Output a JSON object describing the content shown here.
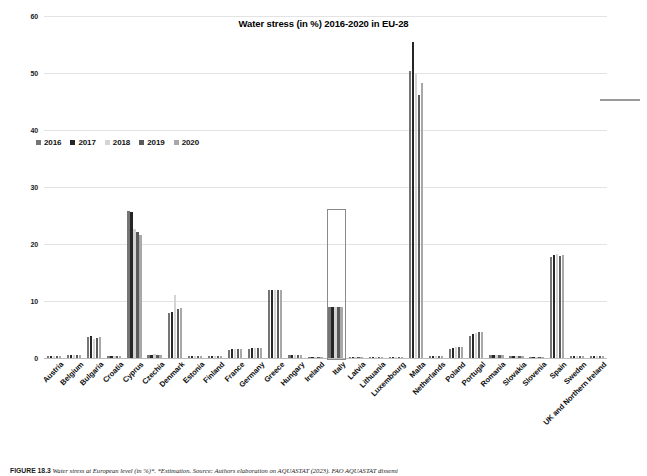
{
  "figure": {
    "title": "Water stress (in %) 2016-2020 in EU-28",
    "caption_label": "FIGURE 18.3",
    "caption_text": "Water stress at European level (in %)*. *Estimation. Source: Authors elaboration on AQUASTAT (2023). FAO AQUASTAT dissemi"
  },
  "legend": {
    "position": "upper-left-inside",
    "items": [
      {
        "label": "2016",
        "color": "#757575"
      },
      {
        "label": "2017",
        "color": "#262626"
      },
      {
        "label": "2018",
        "color": "#d4d4d4"
      },
      {
        "label": "2019",
        "color": "#5a5a5a"
      },
      {
        "label": "2020",
        "color": "#a8a8a8"
      }
    ]
  },
  "chart_data": {
    "type": "bar",
    "title": "Water stress (in %) 2016-2020 in EU-28",
    "xlabel": "",
    "ylabel": "",
    "ylim": [
      0,
      60
    ],
    "yticks": [
      0,
      10,
      20,
      30,
      40,
      50,
      60
    ],
    "grid": true,
    "legend_position": "upper-left-inside",
    "categories": [
      "Austria",
      "Belgium",
      "Bulgaria",
      "Croatia",
      "Cyprus",
      "Czechia",
      "Denmark",
      "Estonia",
      "Finland",
      "France",
      "Germany",
      "Greece",
      "Hungary",
      "Ireland",
      "Italy",
      "Latvia",
      "Lithuania",
      "Luxembourg",
      "Malta",
      "Netherlands",
      "Poland",
      "Portugal",
      "Romania",
      "Slovakia",
      "Slovenia",
      "Spain",
      "Sweden",
      "UK and Northern Ireland"
    ],
    "series": [
      {
        "name": "2016",
        "color": "#757575",
        "values": [
          0.4,
          0.5,
          3.6,
          0.3,
          25.8,
          0.6,
          7.9,
          0.3,
          0.3,
          1.4,
          1.6,
          11.9,
          0.5,
          0.2,
          8.9,
          0.2,
          0.2,
          0.2,
          50.4,
          0.3,
          1.6,
          3.9,
          0.5,
          0.3,
          0.2,
          17.8,
          0.3,
          0.4
        ]
      },
      {
        "name": "2017",
        "color": "#262626",
        "values": [
          0.4,
          0.5,
          3.8,
          0.3,
          25.6,
          0.6,
          8.0,
          0.3,
          0.3,
          1.5,
          1.7,
          12.0,
          0.5,
          0.2,
          9.0,
          0.2,
          0.2,
          0.2,
          55.4,
          0.3,
          1.7,
          4.2,
          0.5,
          0.3,
          0.2,
          18.0,
          0.3,
          0.4
        ]
      },
      {
        "name": "2018",
        "color": "#d4d4d4",
        "values": [
          0.4,
          0.6,
          3.3,
          0.3,
          22.7,
          0.7,
          11.0,
          0.3,
          0.3,
          1.6,
          1.8,
          11.9,
          0.5,
          0.2,
          8.9,
          0.2,
          0.2,
          0.2,
          49.9,
          0.3,
          2.0,
          4.4,
          0.5,
          0.3,
          0.2,
          18.2,
          0.3,
          0.4
        ]
      },
      {
        "name": "2019",
        "color": "#5a5a5a",
        "values": [
          0.4,
          0.5,
          3.5,
          0.3,
          22.1,
          0.6,
          8.6,
          0.3,
          0.3,
          1.5,
          1.7,
          11.9,
          0.5,
          0.2,
          9.0,
          0.2,
          0.2,
          0.2,
          46.1,
          0.3,
          1.9,
          4.5,
          0.5,
          0.3,
          0.2,
          17.9,
          0.3,
          0.4
        ]
      },
      {
        "name": "2020",
        "color": "#a8a8a8",
        "values": [
          0.4,
          0.5,
          3.6,
          0.3,
          21.6,
          0.6,
          8.7,
          0.3,
          0.3,
          1.5,
          1.7,
          11.9,
          0.5,
          0.2,
          8.9,
          0.2,
          0.2,
          0.2,
          48.2,
          0.3,
          1.9,
          4.5,
          0.5,
          0.3,
          0.2,
          18.1,
          0.3,
          0.4
        ]
      }
    ],
    "annotations": [
      {
        "type": "rectangle-highlight",
        "target_category": "Italy",
        "y_from": 0,
        "y_to": 26.2,
        "color": "#8a8a8a"
      }
    ]
  }
}
